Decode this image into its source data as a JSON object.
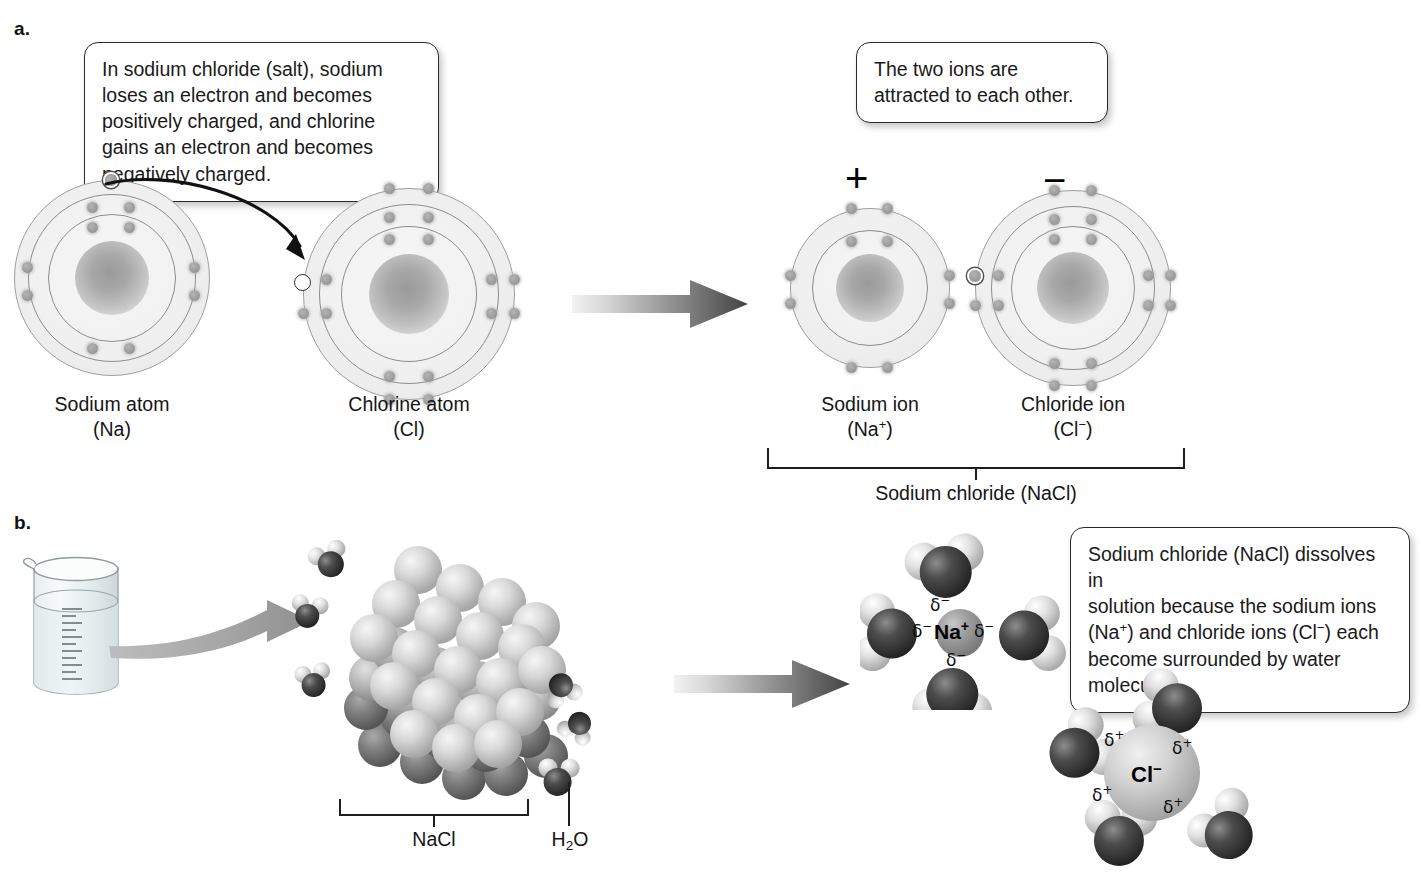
{
  "panels": {
    "a": {
      "letter": "a."
    },
    "b": {
      "letter": "b."
    }
  },
  "callouts": {
    "ionic_bond": "In sodium chloride (salt), sodium loses an electron and becomes positively charged, and chlorine gains an electron and becomes negatively charged.",
    "attraction": "The two ions are attracted to each other.",
    "dissolution_line1": "Sodium chloride (NaCl) dissolves in",
    "dissolution_line2": "solution because the sodium ions",
    "dissolution_line3_a": "(Na",
    "dissolution_line3_sup1": "+",
    "dissolution_line3_b": ") and chloride ions (Cl",
    "dissolution_line3_sup2": "−",
    "dissolution_line3_c": ") each",
    "dissolution_line4": "become surrounded by water",
    "dissolution_line5": "molecules."
  },
  "atoms": {
    "sodium_atom": {
      "name": "Sodium atom",
      "formula_open": "(",
      "symbol": "Na",
      "charge": "",
      "formula_close": ")",
      "shells": [
        2,
        8,
        1
      ],
      "highlighted_electron": "outer valence electron"
    },
    "chlorine_atom": {
      "name": "Chlorine atom",
      "formula_open": "(",
      "symbol": "Cl",
      "charge": "",
      "formula_close": ")",
      "shells": [
        2,
        8,
        7
      ],
      "empty_slot": "incoming electron position"
    },
    "sodium_ion": {
      "name": "Sodium ion",
      "formula_open": "(",
      "symbol": "Na",
      "charge": "+",
      "formula_close": ")",
      "shells": [
        2,
        8
      ],
      "charge_sign": "+"
    },
    "chloride_ion": {
      "name": "Chloride ion",
      "formula_open": "(",
      "symbol": "Cl",
      "charge": "−",
      "formula_close": ")",
      "shells": [
        2,
        8,
        8
      ],
      "charge_sign": "−",
      "highlighted_electron": "transferred electron"
    }
  },
  "brackets": {
    "sodium_chloride": "Sodium chloride (NaCl)",
    "nacl_crystal": "NaCl",
    "water_a": "H",
    "water_sub": "2",
    "water_b": "O"
  },
  "solvation": {
    "sodium_ion_label": "Na",
    "sodium_ion_charge": "+",
    "sodium_delta": "δ",
    "sodium_delta_charge": "−",
    "sodium_delta_count": 4,
    "chloride_ion_label": "Cl",
    "chloride_ion_charge": "−",
    "chloride_delta": "δ",
    "chloride_delta_charge": "+",
    "chloride_delta_count": 4
  },
  "colors": {
    "ink": "#1b1b1b",
    "shell_line": "#8d8d8d",
    "electron": "#9d9d9d",
    "arrow_dark": "#4a4a4a",
    "arrow_light": "#e9e9e9",
    "beaker_glass": "#b9c4c6",
    "crystal_light": "#d7d7d7",
    "crystal_dark": "#6e6e6e",
    "oxygen": "#3b3b3b",
    "hydrogen": "#e8e8e8"
  }
}
